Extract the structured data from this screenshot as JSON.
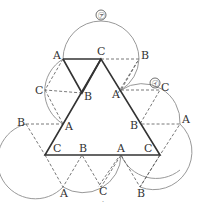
{
  "diagram": {
    "colors": {
      "background": "#ffffff",
      "triangle": "#333333",
      "arc": "#999999",
      "dashed": "#555555",
      "label": "#333333"
    },
    "markers": {
      "upper_arc_label": "㋐",
      "right_arc_label": "㋑"
    },
    "labels": {
      "top_A": "A",
      "top_C": "C",
      "top_B": "B",
      "left_C": "C",
      "left_B_inner": "B",
      "left_B": "B",
      "left_A_inner": "A",
      "right_A_inner": "A",
      "right_C": "C",
      "right_B_inner": "B",
      "right_A": "A",
      "base_C_left": "C",
      "base_B": "B",
      "base_A": "A",
      "base_C_right": "C",
      "bottom_A": "A",
      "bottom_C": "C",
      "bottom_B": "B"
    },
    "dot": "·"
  }
}
